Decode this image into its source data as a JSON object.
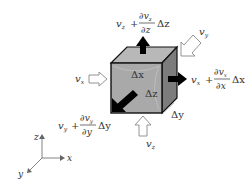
{
  "diagram": {
    "type": "fluid element control volume",
    "cube": {
      "front_color": "#a9a9a9",
      "top_color": "#b8b8b8",
      "side_color": "#7c7c7c",
      "edge_color": "#111111",
      "dims": {
        "dx": "Δx",
        "dy": "Δy",
        "dz": "Δz"
      }
    },
    "inflows": {
      "vx": {
        "sym": "v",
        "sub": "x"
      },
      "vy": {
        "sym": "v",
        "sub": "y"
      },
      "vz": {
        "sym": "v",
        "sub": "z"
      }
    },
    "outflows": {
      "z": {
        "sym": "v",
        "sub": "z",
        "plus": "+",
        "num": "∂v",
        "num_sub": "z",
        "den": "∂z",
        "delta": "Δz"
      },
      "x": {
        "sym": "v",
        "sub": "x",
        "plus": "+",
        "num": "∂v",
        "num_sub": "x",
        "den": "∂x",
        "delta": "Δx"
      },
      "y": {
        "sym": "v",
        "sub": "y",
        "plus": "+",
        "num": "∂v",
        "num_sub": "y",
        "den": "∂y",
        "delta": "Δy"
      }
    },
    "axes": {
      "x": "x",
      "y": "y",
      "z": "z"
    },
    "colors": {
      "outflow_arrow": "#000000",
      "inflow_arrow_stroke": "#888888",
      "inflow_arrow_fill": "#ffffff",
      "axis": "#666666"
    }
  }
}
